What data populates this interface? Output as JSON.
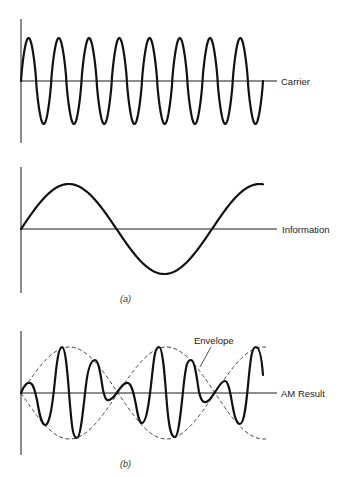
{
  "figure": {
    "panels": [
      {
        "id": "carrier",
        "label": "Carrier",
        "description": "High-frequency sinusoidal carrier wave, 8 cycles"
      },
      {
        "id": "information",
        "label": "Information",
        "description": "Low-frequency sinusoidal information (modulating) signal, ~1.25 cycles"
      },
      {
        "id": "am_result",
        "label": "AM Result",
        "description": "Amplitude-modulated result with dashed envelope following the information signal"
      }
    ],
    "annotations": {
      "envelope_label": "Envelope"
    },
    "captions": {
      "a": "(a)",
      "b": "(b)"
    }
  },
  "colors": {
    "wave": "#111111",
    "axis": "#1a1a1a",
    "background": "#ffffff"
  }
}
